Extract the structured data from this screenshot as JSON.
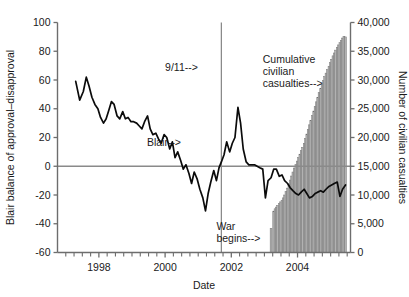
{
  "chart_data": {
    "type": "line",
    "title": "",
    "xlabel": "Date",
    "ylabel": "Blair balance of approval–disapproval",
    "y2label": "Number of civilian casualties",
    "xlim": [
      1996.75,
      2005.6
    ],
    "ylim": [
      -60,
      100
    ],
    "y2lim": [
      0,
      40000
    ],
    "grid": false,
    "legend_position": "none",
    "xticks": [
      1998,
      2000,
      2002,
      2004
    ],
    "xticklabels": [
      "1998",
      "2000",
      "2002",
      "2004"
    ],
    "xminor_step": 0.25,
    "yticks": [
      -60,
      -40,
      -20,
      0,
      20,
      40,
      60,
      80,
      100
    ],
    "yticklabels": [
      "-60",
      "-40",
      "-20",
      "0",
      "20",
      "40",
      "60",
      "80",
      "100"
    ],
    "y2ticks": [
      0,
      5000,
      10000,
      15000,
      20000,
      25000,
      30000,
      35000,
      40000
    ],
    "y2ticklabels": [
      "0",
      "5,000",
      "10,000",
      "15,000",
      "20,000",
      "25,000",
      "30,000",
      "35,000",
      "40,000"
    ],
    "annotations": [
      {
        "name": "blair-label",
        "text": "Blair-->",
        "x": 1999.45,
        "y": 14
      },
      {
        "name": "nine-eleven-label",
        "text": "9/11-->",
        "x": 2000.0,
        "y": 66
      },
      {
        "name": "war-begins-label",
        "text": "War\nbegins-->",
        "lines": [
          "War",
          "begins-->"
        ],
        "x": 2001.55,
        "y": -44
      },
      {
        "name": "cumulative-casualties-label",
        "lines": [
          "Cumulative",
          "civilian",
          "casualties-->"
        ],
        "x": 2002.95,
        "y": 72
      }
    ],
    "event_lines": [
      {
        "name": "nine-eleven-line",
        "x": 2001.7,
        "y_from": -60,
        "y_to": 100
      }
    ],
    "reference_lines": [
      {
        "name": "zero-line",
        "y": 0
      }
    ],
    "series": [
      {
        "name": "Blair balance of approval-disapproval",
        "axis": "left",
        "color": "#0b0b0b",
        "x": [
          1997.3,
          1997.42,
          1997.53,
          1997.62,
          1997.7,
          1997.79,
          1997.88,
          1997.97,
          1998.05,
          1998.14,
          1998.22,
          1998.3,
          1998.38,
          1998.46,
          1998.55,
          1998.63,
          1998.72,
          1998.8,
          1998.88,
          1998.97,
          1999.05,
          1999.14,
          1999.22,
          1999.3,
          1999.38,
          1999.47,
          1999.55,
          1999.63,
          1999.72,
          1999.8,
          1999.88,
          1999.97,
          2000.05,
          2000.14,
          2000.22,
          2000.3,
          2000.38,
          2000.47,
          2000.55,
          2000.63,
          2000.72,
          2000.8,
          2000.88,
          2000.97,
          2001.05,
          2001.14,
          2001.22,
          2001.3,
          2001.38,
          2001.47,
          2001.55,
          2001.63,
          2001.7,
          2001.78,
          2001.86,
          2001.95,
          2002.03,
          2002.11,
          2002.2,
          2002.28,
          2002.36,
          2002.45,
          2002.53,
          2002.61,
          2002.7,
          2002.78,
          2002.86,
          2002.95,
          2003.03,
          2003.11,
          2003.2,
          2003.28,
          2003.36,
          2003.45,
          2003.53,
          2003.61,
          2003.7,
          2003.78,
          2003.86,
          2003.95,
          2004.03,
          2004.11,
          2004.2,
          2004.28,
          2004.36,
          2004.45,
          2004.53,
          2004.61,
          2004.7,
          2004.78,
          2004.86,
          2004.95,
          2005.03,
          2005.11,
          2005.2,
          2005.28,
          2005.36,
          2005.45
        ],
        "values": [
          59,
          46,
          52,
          62,
          56,
          48,
          43,
          40,
          34,
          30,
          33,
          39,
          45,
          43,
          35,
          33,
          38,
          33,
          34,
          31,
          31,
          30,
          28,
          26,
          31,
          35,
          26,
          22,
          23,
          19,
          16,
          22,
          20,
          12,
          17,
          6,
          10,
          4,
          -2,
          1,
          -5,
          -12,
          -4,
          -9,
          -16,
          -22,
          -31,
          -19,
          -11,
          -3,
          -10,
          -1,
          3,
          8,
          17,
          10,
          16,
          20,
          41,
          30,
          12,
          3,
          1,
          1,
          1,
          0,
          -1,
          -2,
          -22,
          -10,
          -8,
          -2,
          -2,
          -7,
          -6,
          -10,
          -12,
          -15,
          -17,
          -19,
          -20,
          -18,
          -16,
          -19,
          -22,
          -21,
          -19,
          -18,
          -17,
          -18,
          -16,
          -14,
          -13,
          -12,
          -11,
          -21,
          -16,
          -13
        ],
        "line_after_war": {
          "note": "continues through 2005 at roughly -10 to -22"
        }
      },
      {
        "name": "Cumulative civilian casualties",
        "axis": "right",
        "type": "bar",
        "color": "#b2b2b2",
        "x": [
          2003.2,
          2003.28,
          2003.32,
          2003.36,
          2003.4,
          2003.45,
          2003.49,
          2003.53,
          2003.57,
          2003.61,
          2003.65,
          2003.7,
          2003.74,
          2003.78,
          2003.82,
          2003.86,
          2003.9,
          2003.95,
          2003.99,
          2004.03,
          2004.07,
          2004.11,
          2004.15,
          2004.2,
          2004.24,
          2004.28,
          2004.32,
          2004.36,
          2004.4,
          2004.45,
          2004.49,
          2004.53,
          2004.57,
          2004.61,
          2004.65,
          2004.7,
          2004.74,
          2004.78,
          2004.82,
          2004.86,
          2004.9,
          2004.95,
          2004.99,
          2005.03,
          2005.07,
          2005.11,
          2005.15,
          2005.2,
          2005.24,
          2005.28,
          2005.32,
          2005.36,
          2005.4,
          2005.45
        ],
        "values": [
          4200,
          7200,
          7600,
          7900,
          8200,
          8500,
          8800,
          9100,
          9500,
          10000,
          10600,
          11200,
          11900,
          12600,
          13300,
          14000,
          14700,
          15300,
          15900,
          16500,
          17100,
          17700,
          18300,
          19000,
          19800,
          20600,
          21400,
          22200,
          23000,
          23800,
          24600,
          25400,
          26200,
          27000,
          27800,
          28500,
          29200,
          29900,
          30600,
          31200,
          31800,
          32400,
          33000,
          33600,
          34200,
          34700,
          35200,
          35700,
          36100,
          36500,
          36900,
          37300,
          37600,
          37500
        ]
      }
    ]
  }
}
